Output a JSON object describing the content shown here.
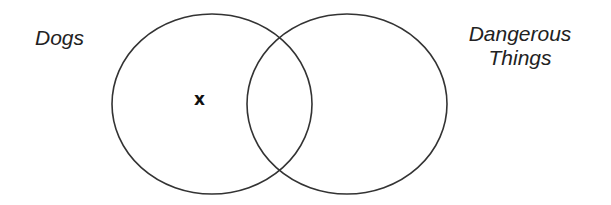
{
  "diagram": {
    "type": "venn",
    "sets": [
      {
        "label": "Dogs",
        "cx": 212,
        "cy": 104,
        "rx": 100,
        "ry": 90
      },
      {
        "label": "Dangerous Things",
        "line1": "Dangerous",
        "line2": "Things",
        "cx": 347,
        "cy": 104,
        "rx": 100,
        "ry": 90
      }
    ],
    "marker": {
      "symbol": "x",
      "region": "Dogs only"
    },
    "stroke_color": "#333333"
  }
}
